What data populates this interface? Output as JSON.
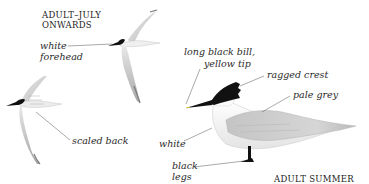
{
  "captions": {
    "juvenile_title_line1": "ADULT–JULY",
    "juvenile_title_line2": "ONWARDS",
    "adult_title": "ADULT SUMMER"
  },
  "labels": {
    "white_forehead_line1": "white",
    "white_forehead_line2": "forehead",
    "scaled_back": "scaled back",
    "bill_line1": "long black bill,",
    "bill_line2": "yellow tip",
    "ragged_crest": "ragged crest",
    "pale_grey": "pale grey",
    "white": "white",
    "black_legs_line1": "black",
    "black_legs_line2": "legs"
  },
  "colors": {
    "background": "#ffffff",
    "cap_black": "#111111",
    "wing_grey": "#c9c9c9",
    "body_white": "#f6f6f6",
    "leader_line": "#555555"
  }
}
